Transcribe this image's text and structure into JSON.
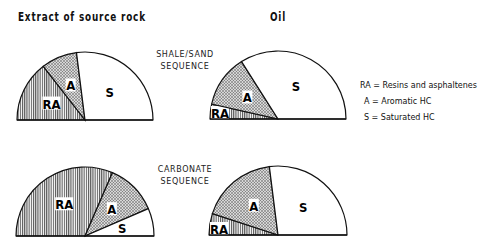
{
  "titles": {
    "source_rock": "Extract of source rock",
    "oil": "Oil"
  },
  "sequences": {
    "shale_sand": [
      "SHALE/SAND",
      "SEQUENCE"
    ],
    "carbonate": [
      "CARBONATE",
      "SEQUENCE"
    ]
  },
  "legend": {
    "ra": "RA = Resins  and  asphaltenes",
    "a": "A = Aromatic   HC",
    "s": "S = Saturated   HC"
  },
  "labels": {
    "ra": "RA",
    "a": "A",
    "s": "S"
  },
  "colors": {
    "ink": "#111111",
    "ra_fill": "#9a9a9a",
    "a_fill": "#b4b4b4",
    "s_fill": "#ffffff"
  },
  "chart_data": [
    {
      "type": "pie",
      "subtype": "semicircle",
      "title": "Extract of source rock — Shale/Sand sequence",
      "categories": [
        "RA",
        "A",
        "S"
      ],
      "values": [
        29,
        17,
        54
      ]
    },
    {
      "type": "pie",
      "subtype": "semicircle",
      "title": "Oil — Shale/Sand sequence",
      "categories": [
        "RA",
        "A",
        "S"
      ],
      "values": [
        7,
        25,
        68
      ]
    },
    {
      "type": "pie",
      "subtype": "semicircle",
      "title": "Extract of source rock — Carbonate sequence",
      "categories": [
        "RA",
        "A",
        "S"
      ],
      "values": [
        63,
        24,
        13
      ]
    },
    {
      "type": "pie",
      "subtype": "semicircle",
      "title": "Oil — Carbonate sequence",
      "categories": [
        "RA",
        "A",
        "S"
      ],
      "values": [
        10,
        36,
        54
      ]
    }
  ]
}
